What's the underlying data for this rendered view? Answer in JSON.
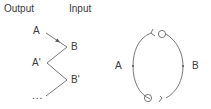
{
  "headers": {
    "output": "Output",
    "input": "Input"
  },
  "left_diagram": {
    "labels": {
      "a": "A",
      "b": "B",
      "a_prime": "A'",
      "b_prime": "B'",
      "ellipsis": "..."
    }
  },
  "right_diagram": {
    "labels": {
      "a": "A",
      "b": "B"
    }
  },
  "colors": {
    "stroke": "#555555",
    "text": "#3a3a3a"
  }
}
